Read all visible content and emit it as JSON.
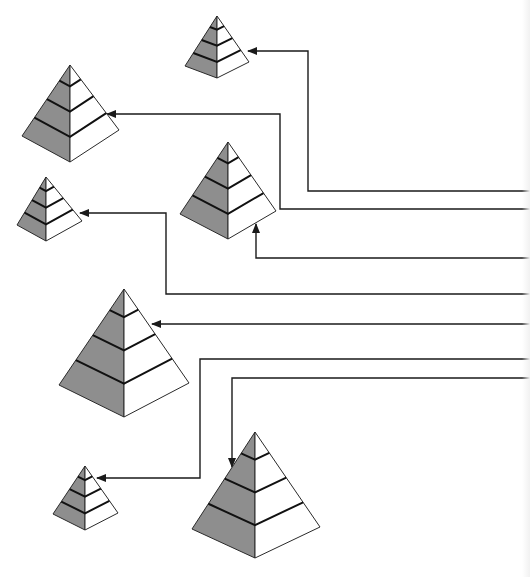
{
  "diagram": {
    "title": "",
    "width": 530,
    "height": 577,
    "colors": {
      "background": "#ffffff",
      "shaded_face": "#8e8e8e",
      "light_face": "#ffffff",
      "outline": "#2a2a2a",
      "band_line": "#111111",
      "connector": "#1a1a1a"
    },
    "pyramids": [
      {
        "id": "pyramid-1",
        "apex": [
          217,
          16
        ],
        "left": [
          185,
          66
        ],
        "bottom": [
          217,
          78
        ],
        "right": [
          249,
          62
        ],
        "bands": 3
      },
      {
        "id": "pyramid-2",
        "apex": [
          70,
          65
        ],
        "left": [
          22,
          136
        ],
        "bottom": [
          70,
          162
        ],
        "right": [
          119,
          130
        ],
        "bands": 3
      },
      {
        "id": "pyramid-3",
        "apex": [
          228,
          142
        ],
        "left": [
          180,
          214
        ],
        "bottom": [
          228,
          239
        ],
        "right": [
          276,
          211
        ],
        "bands": 3
      },
      {
        "id": "pyramid-4",
        "apex": [
          46,
          177
        ],
        "left": [
          17,
          225
        ],
        "bottom": [
          46,
          241
        ],
        "right": [
          82,
          221
        ],
        "bands": 3
      },
      {
        "id": "pyramid-5",
        "apex": [
          124,
          289
        ],
        "left": [
          59,
          385
        ],
        "bottom": [
          124,
          417
        ],
        "right": [
          189,
          383
        ],
        "bands": 3
      },
      {
        "id": "pyramid-6",
        "apex": [
          85,
          466
        ],
        "left": [
          53,
          514
        ],
        "bottom": [
          85,
          530
        ],
        "right": [
          118,
          513
        ],
        "bands": 3
      },
      {
        "id": "pyramid-7",
        "apex": [
          255,
          432
        ],
        "left": [
          192,
          529
        ],
        "bottom": [
          255,
          558
        ],
        "right": [
          320,
          527
        ],
        "bands": 3
      }
    ],
    "connectors": [
      {
        "id": "connector-1",
        "target": "pyramid-1",
        "points": [
          [
            530,
            191
          ],
          [
            308,
            191
          ],
          [
            308,
            51
          ],
          [
            248,
            51
          ]
        ]
      },
      {
        "id": "connector-2",
        "target": "pyramid-2",
        "points": [
          [
            530,
            209
          ],
          [
            280,
            209
          ],
          [
            280,
            114
          ],
          [
            107,
            114
          ]
        ]
      },
      {
        "id": "connector-3",
        "target": "pyramid-3",
        "points": [
          [
            530,
            258
          ],
          [
            256,
            258
          ],
          [
            256,
            224
          ]
        ]
      },
      {
        "id": "connector-4",
        "target": "pyramid-4",
        "points": [
          [
            530,
            294
          ],
          [
            166,
            294
          ],
          [
            166,
            213
          ],
          [
            80,
            213
          ]
        ]
      },
      {
        "id": "connector-5",
        "target": "pyramid-5",
        "points": [
          [
            530,
            324
          ],
          [
            152,
            324
          ]
        ]
      },
      {
        "id": "connector-6",
        "target": "pyramid-6",
        "points": [
          [
            530,
            359
          ],
          [
            200,
            359
          ],
          [
            200,
            478
          ],
          [
            97,
            478
          ]
        ]
      },
      {
        "id": "connector-7",
        "target": "pyramid-7",
        "points": [
          [
            530,
            378
          ],
          [
            232,
            378
          ],
          [
            232,
            467
          ]
        ]
      }
    ]
  }
}
